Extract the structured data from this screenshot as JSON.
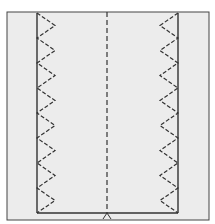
{
  "diagram": {
    "type": "sewing-stitch-diagram",
    "colors": {
      "fabric": "#ececec",
      "line": "#333333",
      "background": "#ffffff"
    },
    "frame": {
      "x": 7,
      "y": 12,
      "width": 202,
      "height": 208
    },
    "left_stitch_x": 37,
    "right_stitch_x": 178,
    "center_fold_x": 107,
    "bottom_seam_y": 213,
    "zigzag": {
      "count": 8,
      "amplitude": 18,
      "top": 13,
      "bottom": 213
    }
  }
}
